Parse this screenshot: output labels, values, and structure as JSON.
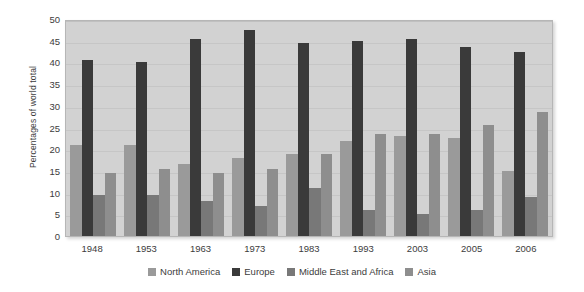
{
  "chart_data": {
    "type": "bar",
    "title": "",
    "xlabel": "",
    "ylabel": "Percentages of world total",
    "categories": [
      "1948",
      "1953",
      "1963",
      "1973",
      "1983",
      "1993",
      "2003",
      "2005",
      "2006"
    ],
    "series": [
      {
        "name": "North America",
        "color": "#9a9a9a",
        "values": [
          21,
          21,
          16.5,
          18,
          19,
          22,
          23,
          22.5,
          15
        ]
      },
      {
        "name": "Europe",
        "color": "#3a3a3a",
        "values": [
          40.5,
          40,
          45.5,
          47.5,
          44.5,
          45,
          45.5,
          43.5,
          42.5
        ]
      },
      {
        "name": "Middle East and Africa",
        "color": "#787878",
        "values": [
          9.5,
          9.5,
          8,
          7,
          11,
          6,
          5,
          6,
          9
        ]
      },
      {
        "name": "Asia",
        "color": "#8e8e8e",
        "values": [
          14.5,
          15.5,
          14.5,
          15.5,
          19,
          23.5,
          23.5,
          25.5,
          28.5
        ]
      }
    ],
    "ylim": [
      0,
      50
    ],
    "yticks": [
      50,
      45,
      40,
      35,
      30,
      25,
      20,
      15,
      10,
      5,
      0
    ],
    "grid": true,
    "legend_position": "bottom",
    "plot_background": "#d2d2d2"
  }
}
